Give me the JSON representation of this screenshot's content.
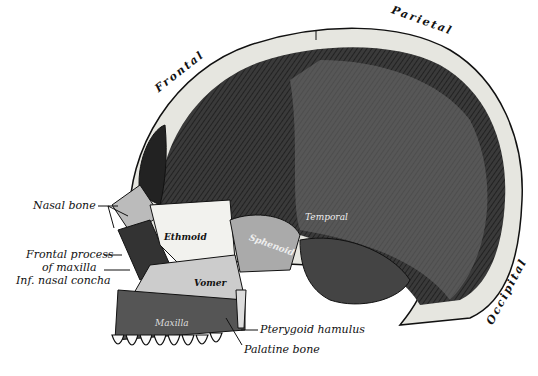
{
  "figure": {
    "region_labels": {
      "frontal": "Frontal",
      "parietal": "Parietal",
      "occipital": "Occipital"
    },
    "inner_labels": {
      "ethmoid": "Ethmoid",
      "sphenoid": "Sphenoid",
      "temporal": "Temporal",
      "vomer": "Vomer",
      "maxilla": "Maxilla"
    },
    "callouts": {
      "nasal_bone": "Nasal bone",
      "frontal_process_1": "Frontal process",
      "frontal_process_2": "of maxilla",
      "inf_nasal_concha": "Inf. nasal concha",
      "pterygoid_hamulus": "Pterygoid hamulus",
      "palatine_bone": "Palatine bone"
    },
    "colors": {
      "background": "#ffffff",
      "bone": "#e6e6e0",
      "cavity": "#2a2a2a",
      "ink": "#111111"
    }
  }
}
